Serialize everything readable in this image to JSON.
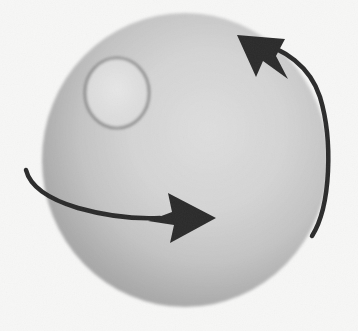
{
  "figure": {
    "title": "Rotating sphere with surface feature and motion arrows",
    "type": "diagram",
    "width": 358,
    "height": 331,
    "background_color": "#f7f7f6",
    "background_noise": "scanned-paper-grain"
  },
  "sphere": {
    "label": "sphere",
    "center_x": 185,
    "center_y": 160,
    "radius_x": 143,
    "radius_y": 147,
    "fill_light": "#dcdcdc",
    "fill_mid": "#c3c3c3",
    "fill_dark": "#9a9a9a",
    "edge_color": "#b0b0b0",
    "highlight_x": 215,
    "highlight_y": 120
  },
  "spot": {
    "label": "surface-feature-circle",
    "center_x": 117,
    "center_y": 93,
    "radius_x": 32,
    "radius_y": 35,
    "fill": "#e0e0e0",
    "stroke": "#6f6f6f",
    "stroke_width": 2
  },
  "arrows": [
    {
      "id": "rotation-arrow",
      "label": "rotation arrow along right limb pointing up",
      "direction": "counterclockwise",
      "stroke": "#2b2b2b",
      "stroke_width": 4.5,
      "path": "M 312 236 C 331 206 333 140 320 97 C 310 66 283 48 258 43",
      "head_tip_x": 237,
      "head_tip_y": 35,
      "head_points": "237,35 285,39 276,56 288,79 263,61 256,77"
    },
    {
      "id": "motion-arrow",
      "label": "horizontal motion arrow pointing right",
      "direction": "rightward",
      "stroke": "#2b2b2b",
      "stroke_width": 4.5,
      "path": "M 26 170 C 30 186 48 199 78 208 C 110 217 140 219 160 218",
      "head_tip_x": 216,
      "head_tip_y": 218,
      "head_points": "216,218 168,193 172,212 148,221 174,225 170,243"
    }
  ]
}
